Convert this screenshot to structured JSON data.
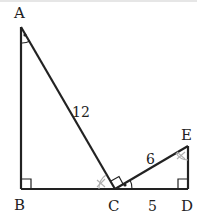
{
  "diagram": {
    "type": "geometry",
    "points": {
      "A": {
        "label": "A",
        "x": 21,
        "y": 27
      },
      "B": {
        "label": "B",
        "x": 21,
        "y": 189
      },
      "C": {
        "label": "C",
        "x": 115,
        "y": 189
      },
      "D": {
        "label": "D",
        "x": 188,
        "y": 189
      },
      "E": {
        "label": "E",
        "x": 188,
        "y": 146
      }
    },
    "segments": [
      {
        "from": "A",
        "to": "B"
      },
      {
        "from": "B",
        "to": "D"
      },
      {
        "from": "A",
        "to": "C"
      },
      {
        "from": "C",
        "to": "E"
      },
      {
        "from": "E",
        "to": "D"
      }
    ],
    "lengths": {
      "AC": "12",
      "CE": "6",
      "CD": "5"
    },
    "right_angles": [
      "B",
      "C (ACE)",
      "D"
    ],
    "angle_marks": {
      "dot_marked": [
        "BAC",
        "ECD"
      ],
      "x_marked": [
        "ACB",
        "CED"
      ]
    },
    "colors": {
      "stroke": "#222222",
      "x_mark": "#b0b0b0"
    }
  }
}
